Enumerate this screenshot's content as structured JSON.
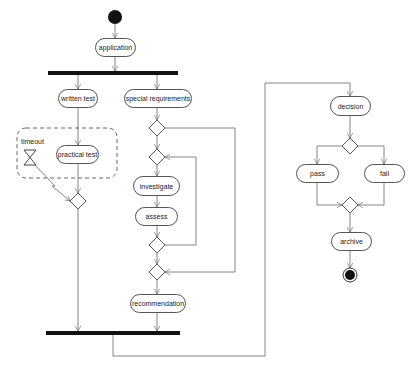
{
  "diagram": {
    "type": "uml-activity",
    "activities": {
      "application": "application",
      "written_test": "written test",
      "special_requirements": "special requirements",
      "practical_test": "practical test",
      "investigate": "investigate",
      "assess": "assess",
      "recommendation": "recommendation",
      "decision": "decision",
      "pass": "pass",
      "fail": "fail",
      "archive": "archive"
    },
    "events": {
      "timeout": "timeout"
    },
    "colors": {
      "line": "#555555",
      "bar": "#111111",
      "node": "#111111"
    }
  }
}
